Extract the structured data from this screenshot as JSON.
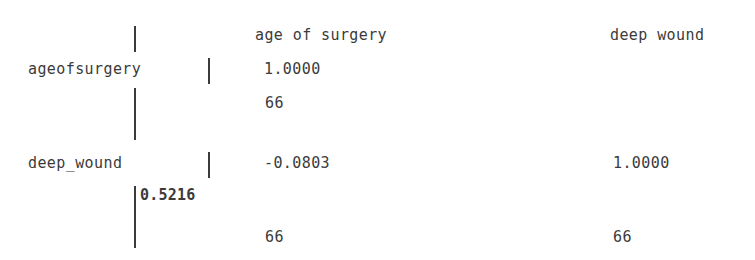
{
  "output": {
    "type": "correlation-matrix",
    "separator": "|",
    "column_headers": [
      "age of surgery",
      "deep wound"
    ],
    "rows": [
      {
        "label": "ageofsurgery",
        "correlations": [
          "1.0000",
          ""
        ],
        "pvalue": "",
        "counts": [
          "66",
          ""
        ]
      },
      {
        "label": "deep_wound",
        "correlations": [
          "-0.0803",
          "1.0000"
        ],
        "pvalue": "0.5216",
        "counts": [
          "66",
          "66"
        ]
      }
    ]
  },
  "chart_data": {
    "type": "table",
    "title": "",
    "variables": [
      "age of surgery",
      "deep wound"
    ],
    "row_labels": [
      "ageofsurgery",
      "deep_wound"
    ],
    "matrix": [
      [
        1.0,
        null
      ],
      [
        -0.0803,
        1.0
      ]
    ],
    "pvalues": [
      [
        null,
        null
      ],
      [
        0.5216,
        null
      ]
    ],
    "observations": [
      [
        66,
        null
      ],
      [
        66,
        66
      ]
    ]
  },
  "colors": {
    "text": "#3b3b3b",
    "background": "#ffffff"
  }
}
